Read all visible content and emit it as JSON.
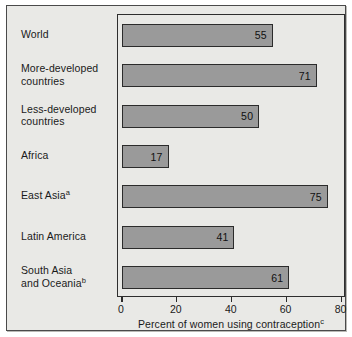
{
  "chart_data": {
    "type": "bar",
    "orientation": "horizontal",
    "title": "",
    "xlabel": "Percent of women using contraception",
    "xlabel_superscript": "c",
    "ylabel": "",
    "xlim": [
      0,
      80
    ],
    "xticks": [
      0,
      20,
      40,
      60,
      80
    ],
    "xtick_labels": [
      "0",
      "20",
      "40",
      "60",
      "80"
    ],
    "grid": false,
    "legend": false,
    "categories": [
      "World",
      "More-developed countries",
      "Less-developed countries",
      "Africa",
      "East Asia",
      "Latin America",
      "South Asia and Oceania"
    ],
    "category_lines": [
      [
        "World"
      ],
      [
        "More-developed",
        "countries"
      ],
      [
        "Less-developed",
        "countries"
      ],
      [
        "Africa"
      ],
      [
        "East Asia"
      ],
      [
        "Latin America"
      ],
      [
        "South Asia",
        "and Oceania"
      ]
    ],
    "category_superscripts": [
      "",
      "",
      "",
      "",
      "a",
      "",
      "b"
    ],
    "values": [
      55,
      71,
      50,
      17,
      75,
      41,
      61
    ],
    "value_labels": [
      "55",
      "71",
      "50",
      "17",
      "75",
      "41",
      "61"
    ],
    "colors": {
      "bar_fill": "#9a9a9a",
      "bar_border": "#2b2b2b",
      "plot_background": "#e9e9e6",
      "figure_border": "#4a4a4a",
      "text": "#1a1a1a"
    }
  }
}
